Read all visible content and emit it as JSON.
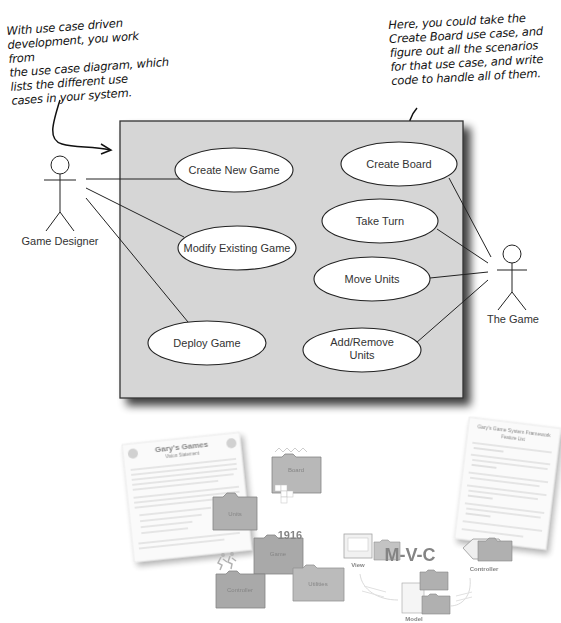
{
  "annotations": {
    "left": "With use case driven\ndevelopment, you work from\nthe use case diagram, which\nlists the different use\ncases in your system.",
    "right": "Here, you could take the\nCreate Board use case, and\nfigure out all the scenarios\nfor that use case, and write\ncode to handle all of them."
  },
  "diagram": {
    "actors": [
      {
        "id": "game-designer",
        "label": "Game Designer"
      },
      {
        "id": "the-game",
        "label": "The Game"
      }
    ],
    "use_cases": [
      {
        "id": "create-new-game",
        "label": "Create New Game",
        "actor": "Game Designer"
      },
      {
        "id": "modify-existing-game",
        "label": "Modify Existing Game",
        "actor": "Game Designer"
      },
      {
        "id": "deploy-game",
        "label": "Deploy Game",
        "actor": "Game Designer"
      },
      {
        "id": "create-board",
        "label": "Create Board",
        "actor": "The Game"
      },
      {
        "id": "take-turn",
        "label": "Take Turn",
        "actor": "The Game"
      },
      {
        "id": "move-units",
        "label": "Move Units",
        "actor": "The Game"
      },
      {
        "id": "add-remove-units",
        "label_line1": "Add/Remove",
        "label_line2": "Units",
        "actor": "The Game"
      }
    ]
  },
  "illustration": {
    "doc_left_title": "Gary's Games",
    "doc_left_subtitle": "Vision Statement",
    "doc_right_title": "Gary's Game System Framework",
    "doc_right_subtitle": "Feature List",
    "folders": [
      "Units",
      "Board",
      "Game",
      "Controller",
      "Utilities",
      "View",
      "Model"
    ],
    "year": "1916",
    "mvc": "M-V-C",
    "labels": {
      "view": "View",
      "controller": "Controller",
      "model": "Model"
    }
  }
}
